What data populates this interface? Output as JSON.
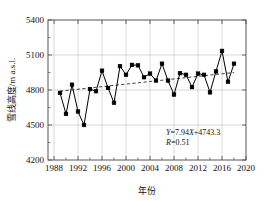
{
  "chart_data": {
    "type": "line",
    "title": "",
    "xlabel": "年份",
    "ylabel": "雪线高度/m a.s.l.",
    "xlim": [
      1987,
      2020
    ],
    "ylim": [
      4200,
      5400
    ],
    "xticks": [
      1988,
      1992,
      1996,
      2000,
      2004,
      2008,
      2012,
      2016,
      2020
    ],
    "xtick_labels": [
      "1988",
      "1992",
      "1996",
      "2000",
      "2004",
      "2008",
      "2012",
      "2016",
      "2020"
    ],
    "yticks": [
      4200,
      4500,
      4800,
      5100,
      5400
    ],
    "ytick_labels": [
      "4200",
      "4500",
      "4800",
      "5100",
      "5400"
    ],
    "grid": true,
    "legend": null,
    "marker": "square",
    "line_color": "#000000",
    "trend_color": "#2b2b2b",
    "grid_color": "#c9c9c9",
    "series": [
      {
        "name": "雪线高度",
        "x": [
          1989,
          1990,
          1991,
          1992,
          1993,
          1994,
          1995,
          1996,
          1997,
          1998,
          1999,
          2000,
          2001,
          2002,
          2003,
          2004,
          2005,
          2006,
          2007,
          2008,
          2009,
          2010,
          2011,
          2012,
          2013,
          2014,
          2015,
          2016,
          2017,
          2018
        ],
        "values": [
          4775,
          4595,
          4845,
          4615,
          4500,
          4808,
          4790,
          4965,
          4818,
          4690,
          5005,
          4930,
          5015,
          5012,
          4910,
          4940,
          4880,
          5025,
          4880,
          4760,
          4945,
          4930,
          4825,
          4940,
          4930,
          4780,
          4960,
          5135,
          4870,
          5025
        ]
      }
    ],
    "trend": {
      "equation_label": "Y=7.94X+4743.3",
      "r_label": "R=0.51",
      "slope": 7.94,
      "intercept": 4743.3,
      "r": 0.51,
      "x_start": 1989,
      "x_end": 2018,
      "y_start": 4790,
      "y_end": 4950,
      "style": "dashed"
    },
    "annotations": [
      {
        "text": "Y=7.94X+4743.3",
        "x": 2005.5,
        "y": 4430
      },
      {
        "text": "R=0.51",
        "x": 2005.5,
        "y": 4370
      }
    ]
  },
  "annotation_parts": {
    "eq_y": "Y",
    "eq_mid": "=7.94",
    "eq_x": "X",
    "eq_tail": "+4743.3",
    "r_sym": "R",
    "r_tail": "=0.51"
  }
}
